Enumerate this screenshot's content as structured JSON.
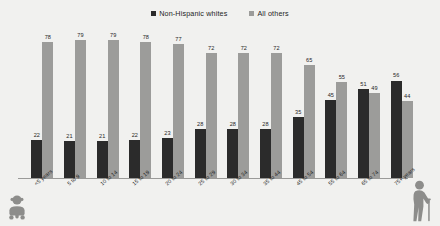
{
  "chart_data": {
    "type": "bar",
    "title": "",
    "xlabel": "",
    "ylabel": "",
    "ylim": [
      0,
      85
    ],
    "grid": false,
    "legend_position": "top-center",
    "categories": [
      "<5 years",
      "5 to 9",
      "10 to 14",
      "15 to 19",
      "20 to 24",
      "25 to 29",
      "30 to 34",
      "35 to 44",
      "45 to 54",
      "55 to 64",
      "65 to 74",
      "75+ years"
    ],
    "series": [
      {
        "name": "Non-Hispanic whites",
        "color": "#2b2b2b",
        "values": [
          22,
          21,
          21,
          22,
          23,
          28,
          28,
          28,
          35,
          45,
          51,
          56
        ]
      },
      {
        "name": "All others",
        "color": "#9c9c9a",
        "values": [
          78,
          79,
          79,
          78,
          77,
          72,
          72,
          72,
          65,
          55,
          49,
          44
        ]
      }
    ]
  },
  "legend": {
    "items": [
      {
        "label": "Non-Hispanic whites",
        "color": "#2b2b2b"
      },
      {
        "label": "All others",
        "color": "#9c9c9a"
      }
    ]
  },
  "icons": {
    "left": "baby-icon",
    "right": "elderly-person-with-cane-icon"
  }
}
